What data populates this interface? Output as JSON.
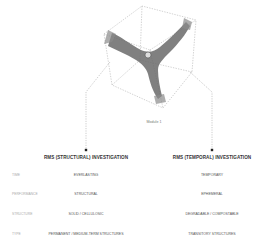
{
  "figure": {
    "caption": "Module 1"
  },
  "columns": [
    {
      "heading": "RMS (STRUCTURAL) INVESTIGATION"
    },
    {
      "heading": "RMS (TEMPORAL) INVESTIGATION"
    }
  ],
  "rows": [
    {
      "label": "TIME",
      "left": "EVERLASTING",
      "right": "TEMPORARY"
    },
    {
      "label": "PERFORMANCE",
      "left": "STRUCTURAL",
      "right": "EPHEMERAL"
    },
    {
      "label": "STRUCTURE",
      "left": "SOLID / CELLULOSIC",
      "right": "DEGRADABLE / COMPOSTABLE"
    },
    {
      "label": "TYPE",
      "left": "PERMANENT / MEDIUM-TERM STRUCTURES",
      "right": "TRANSITORY STRUCTURES"
    }
  ],
  "colors": {
    "line": "#999999",
    "form": "#4a4a4a",
    "marker": "#222222"
  }
}
